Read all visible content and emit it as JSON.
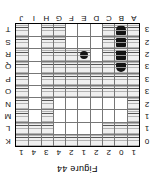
{
  "caption": "Figure 44",
  "board": {
    "column_clues": [
      1,
      0,
      2,
      2,
      1,
      2,
      4,
      3,
      4,
      1
    ],
    "row_clues": [
      0,
      1,
      1,
      2,
      3,
      3,
      3,
      2,
      2,
      3
    ],
    "column_letters": [
      "A",
      "B",
      "C",
      "D",
      "E",
      "F",
      "G",
      "H",
      "I",
      "J"
    ],
    "row_letters": [
      "K",
      "L",
      "M",
      "N",
      "O",
      "P",
      "Q",
      "R",
      "S",
      "T"
    ],
    "legend": {
      "water": "water-cell",
      "empty": "unknown-cell",
      "ship": "ship-segment"
    },
    "cells": [
      [
        "water",
        "water",
        "water",
        "water",
        "water",
        "water",
        "water",
        "water",
        "water",
        "water"
      ],
      [
        "water",
        "water",
        "water",
        "empty",
        "empty",
        "empty",
        "empty",
        "water",
        "water",
        "water"
      ],
      [
        "water",
        "empty",
        "empty",
        "empty",
        "empty",
        "empty",
        "empty",
        "water",
        "empty",
        "water"
      ],
      [
        "water",
        "empty",
        "empty",
        "empty",
        "empty",
        "empty",
        "empty",
        "water",
        "empty",
        "water"
      ],
      [
        "water",
        "water",
        "water",
        "water",
        "water",
        "water",
        "water",
        "water",
        "empty",
        "water"
      ],
      [
        "water",
        "water",
        "water",
        "water",
        "water",
        "water",
        "water",
        "water",
        "empty",
        "water"
      ],
      [
        "water",
        "ship",
        "water",
        "water",
        "water",
        "water",
        "water",
        "water",
        "empty",
        "water"
      ],
      [
        "water",
        "ship",
        "water",
        "empty",
        "ship",
        "water",
        "water",
        "water",
        "empty",
        "water"
      ],
      [
        "water",
        "ship",
        "water",
        "empty",
        "empty",
        "empty",
        "water",
        "water",
        "empty",
        "water"
      ],
      [
        "water",
        "ship",
        "water",
        "empty",
        "empty",
        "empty",
        "water",
        "water",
        "empty",
        "water"
      ]
    ],
    "ships": [
      {
        "name": "vertical-ship-upper",
        "orientation": "vertical",
        "length": 3,
        "column": 8,
        "rows": [
          2,
          3,
          4
        ],
        "shapes": [
          "end-up",
          "mid",
          "end-down"
        ]
      },
      {
        "name": "vertical-ship-lower",
        "orientation": "vertical",
        "length": 4,
        "column": 1,
        "rows": [
          6,
          7,
          8,
          9
        ],
        "shapes": [
          "end-up",
          "mid",
          "mid",
          "end-down"
        ]
      },
      {
        "name": "submarine",
        "orientation": "single",
        "length": 1,
        "column": 4,
        "rows": [
          7
        ],
        "shapes": [
          "sub"
        ]
      }
    ]
  }
}
